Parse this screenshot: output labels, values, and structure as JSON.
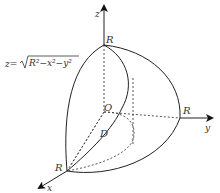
{
  "diagram": {
    "type": "3d-octant-sphere",
    "colors": {
      "stroke": "#222222",
      "dashed": "#444444",
      "text": "#333333"
    },
    "labels": {
      "z_axis": "z",
      "y_axis": "y",
      "x_axis": "x",
      "origin": "O",
      "region": "D",
      "r_top": "R",
      "r_right": "R",
      "r_left": "R"
    },
    "surface_equation": {
      "lhs": "z=",
      "radicand": "R²−x²−y²"
    }
  }
}
